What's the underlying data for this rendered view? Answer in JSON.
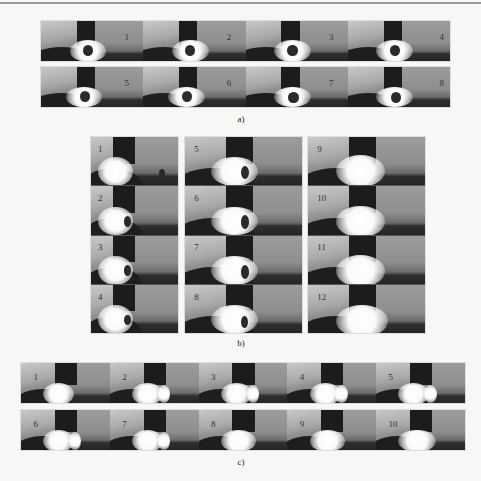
{
  "figure": {
    "a": {
      "label": "a)",
      "rows": [
        {
          "frames": [
            "1",
            "2",
            "3",
            "4"
          ]
        },
        {
          "frames": [
            "5",
            "6",
            "7",
            "8"
          ]
        }
      ]
    },
    "b": {
      "label": "b)",
      "columns": [
        {
          "frames": [
            "1",
            "2",
            "3",
            "4"
          ]
        },
        {
          "frames": [
            "5",
            "6",
            "7",
            "8"
          ]
        },
        {
          "frames": [
            "9",
            "10",
            "11",
            "12"
          ]
        }
      ]
    },
    "c": {
      "label": "c)",
      "rows": [
        {
          "frames": [
            "1",
            "2",
            "3",
            "4",
            "5"
          ]
        },
        {
          "frames": [
            "6",
            "7",
            "8",
            "9",
            "10"
          ]
        }
      ]
    }
  }
}
